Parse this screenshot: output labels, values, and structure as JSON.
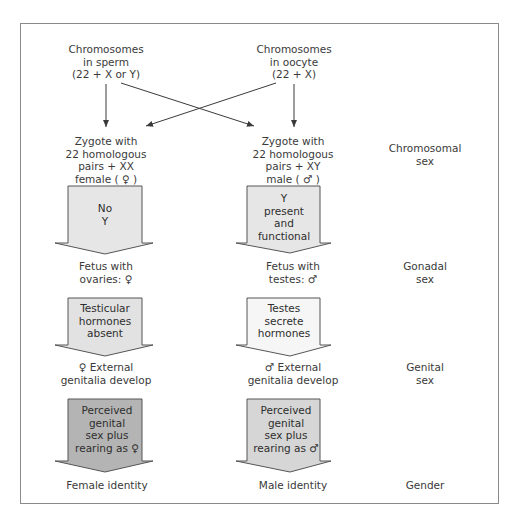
{
  "colors": {
    "frame": "#8a8a8a",
    "line": "#3a3a3a",
    "arrow_light": "#e6e6e6",
    "arrow_dark": "#b4b4b4",
    "arrow_stroke": "#555555",
    "text": "#3a3a3a"
  },
  "top": {
    "sperm": "Chromosomes\nin sperm\n(22 + X or Y)",
    "oocyte": "Chromosomes\nin oocyte\n(22 + X)"
  },
  "stages": [
    {
      "female": "Zygote with\n22 homologous\npairs + XX\nfemale ( ♀ )",
      "male": "Zygote with\n22 homologous\npairs + XY\nmale ( ♂ )",
      "category": "Chromosomal\nsex"
    },
    {
      "female_arrow": "No\nY",
      "male_arrow": "Y\npresent\nand\nfunctional",
      "female": "Fetus with\novaries:  ♀",
      "male": "Fetus with\ntestes:  ♂",
      "category": "Gonadal\nsex"
    },
    {
      "female_arrow": "Testicular\nhormones\nabsent",
      "male_arrow": "Testes\nsecrete\nhormones",
      "female": "♀ External\ngenitalia develop",
      "male": "♂ External\ngenitalia develop",
      "category": "Genital\nsex"
    },
    {
      "female_arrow": "Perceived\ngenital\nsex plus\nrearing as ♀",
      "male_arrow": "Perceived\ngenital\nsex plus\nrearing as ♂",
      "female": "Female identity",
      "male": "Male identity",
      "category": "Gender"
    }
  ]
}
